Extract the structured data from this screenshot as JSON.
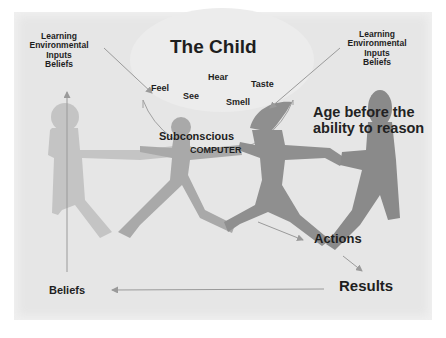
{
  "diagram": {
    "title": "The Child",
    "left_inputs": [
      "Learning",
      "Environmental",
      "Inputs",
      "Beliefs"
    ],
    "right_inputs": [
      "Learning",
      "Environmental",
      "Inputs",
      "Beliefs"
    ],
    "senses": {
      "feel": "Feel",
      "see": "See",
      "hear": "Hear",
      "smell": "Smell",
      "taste": "Taste"
    },
    "center": {
      "line1": "Subconscious",
      "line2": "Computer"
    },
    "age_label": {
      "line1": "Age before the",
      "line2": "ability to reason"
    },
    "actions": "Actions",
    "results": "Results",
    "beliefs": "Beliefs",
    "colors": {
      "background": "#e6e6e6",
      "figure_light": "#bdbdbd",
      "figure_dark": "#8f8f8f",
      "arrow": "#9a9a9a",
      "text": "#1e1e1e"
    }
  }
}
